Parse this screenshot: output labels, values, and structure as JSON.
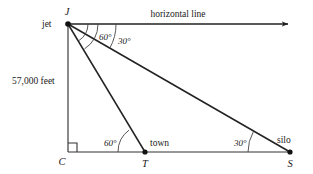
{
  "figure": {
    "type": "geometry-diagram",
    "background_color": "#ffffff",
    "line_color": "#222222",
    "text_color": "#1a1a1a",
    "width": 313,
    "height": 174
  },
  "labels": {
    "jet": "jet",
    "vertex_j": "J",
    "vertex_c": "C",
    "vertex_t": "T",
    "vertex_s": "S",
    "town": "town",
    "silo": "silo",
    "horizontal_line": "horizontal line",
    "altitude": "57,000 feet"
  },
  "angles": {
    "at_jet_to_town": "60°",
    "at_jet_to_silo": "30°",
    "at_town": "60°",
    "at_silo": "30°",
    "at_c": "90°"
  },
  "points": {
    "J": {
      "x": 68,
      "y": 24,
      "name": "jet"
    },
    "C": {
      "x": 68,
      "y": 152,
      "name": "ground-point-below-jet"
    },
    "T": {
      "x": 145,
      "y": 152,
      "name": "town"
    },
    "S": {
      "x": 290,
      "y": 152,
      "name": "silo"
    },
    "H": {
      "x": 292,
      "y": 24,
      "name": "horizontal-ray-end"
    }
  },
  "segments": [
    {
      "name": "horizontal-ray",
      "from": "J",
      "to": "H",
      "arrow": true
    },
    {
      "name": "altitude-segment",
      "from": "J",
      "to": "C",
      "arrow": false
    },
    {
      "name": "ground-segment",
      "from": "C",
      "to": "S",
      "arrow": false
    },
    {
      "name": "jet-to-town",
      "from": "J",
      "to": "T",
      "arrow": false
    },
    {
      "name": "jet-to-silo",
      "from": "J",
      "to": "S",
      "arrow": false
    }
  ]
}
